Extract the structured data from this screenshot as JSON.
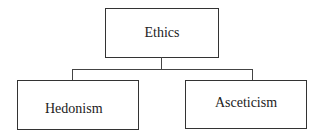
{
  "diagram": {
    "type": "tree",
    "root": {
      "label": "Ethics"
    },
    "children": [
      {
        "label": "Hedonism"
      },
      {
        "label": "Asceticism"
      }
    ]
  }
}
